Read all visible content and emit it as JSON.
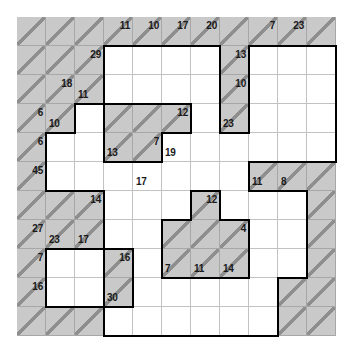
{
  "puzzle": {
    "type": "kakuro",
    "title": "Kakuro puzzle grid",
    "grid_size": {
      "cols": 11,
      "rows": 11
    },
    "cell_px": 29,
    "colors": {
      "shaded_cell": "#c9c9c9",
      "open_cell": "#ffffff",
      "diagonal_line": "#8e8e8e",
      "thin_grid_line": "#c2c2c2",
      "outline": "#000000",
      "clue_text": "#1a1a1a"
    },
    "clues": [
      {
        "name": "clue-r0c3-down",
        "row": 0,
        "col": 3,
        "dir": "down",
        "value": "11"
      },
      {
        "name": "clue-r0c4-down",
        "row": 0,
        "col": 4,
        "dir": "down",
        "value": "10"
      },
      {
        "name": "clue-r0c5-down",
        "row": 0,
        "col": 5,
        "dir": "down",
        "value": "17"
      },
      {
        "name": "clue-r0c6-down",
        "row": 0,
        "col": 6,
        "dir": "down",
        "value": "20"
      },
      {
        "name": "clue-r0c8-down",
        "row": 0,
        "col": 8,
        "dir": "down",
        "value": "7"
      },
      {
        "name": "clue-r0c9-down",
        "row": 0,
        "col": 9,
        "dir": "down",
        "value": "23"
      },
      {
        "name": "clue-r1c2-down",
        "row": 1,
        "col": 2,
        "dir": "down",
        "value": "29"
      },
      {
        "name": "clue-r1c7-down",
        "row": 1,
        "col": 7,
        "dir": "down",
        "value": "13"
      },
      {
        "name": "clue-r2c1-down",
        "row": 2,
        "col": 1,
        "dir": "down",
        "value": "18"
      },
      {
        "name": "clue-r2c2-across",
        "row": 2,
        "col": 2,
        "dir": "across",
        "value": "11"
      },
      {
        "name": "clue-r2c7-down",
        "row": 2,
        "col": 7,
        "dir": "down",
        "value": "10"
      },
      {
        "name": "clue-r3c0-down",
        "row": 3,
        "col": 0,
        "dir": "down",
        "value": "6"
      },
      {
        "name": "clue-r3c1-across",
        "row": 3,
        "col": 1,
        "dir": "across",
        "value": "10"
      },
      {
        "name": "clue-r3c7-across",
        "row": 3,
        "col": 7,
        "dir": "across",
        "value": "23"
      },
      {
        "name": "clue-r3c5-down",
        "row": 3,
        "col": 5,
        "dir": "down",
        "value": "12"
      },
      {
        "name": "clue-r4c0-down",
        "row": 4,
        "col": 0,
        "dir": "down",
        "value": "6"
      },
      {
        "name": "clue-r4c3-across",
        "row": 4,
        "col": 3,
        "dir": "across",
        "value": "13"
      },
      {
        "name": "clue-r4c5-across",
        "row": 4,
        "col": 5,
        "dir": "across",
        "value": "19"
      },
      {
        "name": "clue-r4c4-down",
        "row": 4,
        "col": 4,
        "dir": "down",
        "value": "7"
      },
      {
        "name": "clue-r5c0-down",
        "row": 5,
        "col": 0,
        "dir": "down",
        "value": "45"
      },
      {
        "name": "clue-r5c4-across",
        "row": 5,
        "col": 4,
        "dir": "across",
        "value": "17"
      },
      {
        "name": "clue-r5c8-across",
        "row": 5,
        "col": 8,
        "dir": "across",
        "value": "11"
      },
      {
        "name": "clue-r5c9-across",
        "row": 5,
        "col": 9,
        "dir": "across",
        "value": "8"
      },
      {
        "name": "clue-r6c2-down",
        "row": 6,
        "col": 2,
        "dir": "down",
        "value": "14"
      },
      {
        "name": "clue-r6c6-down",
        "row": 6,
        "col": 6,
        "dir": "down",
        "value": "12"
      },
      {
        "name": "clue-r7c0-down",
        "row": 7,
        "col": 0,
        "dir": "down",
        "value": "27"
      },
      {
        "name": "clue-r7c1-across",
        "row": 7,
        "col": 1,
        "dir": "across",
        "value": "23"
      },
      {
        "name": "clue-r7c2-across",
        "row": 7,
        "col": 2,
        "dir": "across",
        "value": "17"
      },
      {
        "name": "clue-r7c7-down",
        "row": 7,
        "col": 7,
        "dir": "down",
        "value": "4"
      },
      {
        "name": "clue-r8c0-down",
        "row": 8,
        "col": 0,
        "dir": "down",
        "value": "7"
      },
      {
        "name": "clue-r8c3-down",
        "row": 8,
        "col": 3,
        "dir": "down",
        "value": "16"
      },
      {
        "name": "clue-r8c5-across",
        "row": 8,
        "col": 5,
        "dir": "across",
        "value": "7"
      },
      {
        "name": "clue-r8c6-across",
        "row": 8,
        "col": 6,
        "dir": "across",
        "value": "11"
      },
      {
        "name": "clue-r8c7-across",
        "row": 8,
        "col": 7,
        "dir": "across",
        "value": "14"
      },
      {
        "name": "clue-r9c0-down",
        "row": 9,
        "col": 0,
        "dir": "down",
        "value": "16"
      },
      {
        "name": "clue-r9c3-across",
        "row": 9,
        "col": 3,
        "dir": "across",
        "value": "30"
      }
    ],
    "shaded_cells": [
      [
        0,
        0
      ],
      [
        0,
        1
      ],
      [
        0,
        2
      ],
      [
        0,
        3
      ],
      [
        0,
        4
      ],
      [
        0,
        5
      ],
      [
        0,
        6
      ],
      [
        0,
        7
      ],
      [
        0,
        8
      ],
      [
        0,
        9
      ],
      [
        0,
        10
      ],
      [
        1,
        0
      ],
      [
        1,
        1
      ],
      [
        1,
        2
      ],
      [
        1,
        7
      ],
      [
        2,
        0
      ],
      [
        2,
        1
      ],
      [
        2,
        2
      ],
      [
        2,
        7
      ],
      [
        3,
        0
      ],
      [
        3,
        1
      ],
      [
        3,
        3
      ],
      [
        3,
        4
      ],
      [
        3,
        5
      ],
      [
        3,
        7
      ],
      [
        4,
        0
      ],
      [
        4,
        3
      ],
      [
        4,
        4
      ],
      [
        5,
        0
      ],
      [
        5,
        8
      ],
      [
        5,
        9
      ],
      [
        5,
        10
      ],
      [
        6,
        0
      ],
      [
        6,
        1
      ],
      [
        6,
        2
      ],
      [
        6,
        6
      ],
      [
        6,
        10
      ],
      [
        7,
        0
      ],
      [
        7,
        1
      ],
      [
        7,
        2
      ],
      [
        7,
        5
      ],
      [
        7,
        6
      ],
      [
        7,
        7
      ],
      [
        7,
        10
      ],
      [
        8,
        0
      ],
      [
        8,
        3
      ],
      [
        8,
        5
      ],
      [
        8,
        6
      ],
      [
        8,
        7
      ],
      [
        8,
        10
      ],
      [
        9,
        0
      ],
      [
        9,
        3
      ],
      [
        9,
        9
      ],
      [
        9,
        10
      ],
      [
        10,
        0
      ],
      [
        10,
        1
      ],
      [
        10,
        2
      ],
      [
        10,
        9
      ],
      [
        10,
        10
      ]
    ],
    "open_cells": [
      [
        1,
        3
      ],
      [
        1,
        4
      ],
      [
        1,
        5
      ],
      [
        1,
        6
      ],
      [
        1,
        8
      ],
      [
        1,
        9
      ],
      [
        1,
        10
      ],
      [
        2,
        3
      ],
      [
        2,
        4
      ],
      [
        2,
        5
      ],
      [
        2,
        6
      ],
      [
        2,
        8
      ],
      [
        2,
        9
      ],
      [
        2,
        10
      ],
      [
        3,
        2
      ],
      [
        3,
        6
      ],
      [
        3,
        8
      ],
      [
        3,
        9
      ],
      [
        3,
        10
      ],
      [
        4,
        1
      ],
      [
        4,
        2
      ],
      [
        4,
        5
      ],
      [
        4,
        6
      ],
      [
        4,
        7
      ],
      [
        4,
        8
      ],
      [
        4,
        9
      ],
      [
        4,
        10
      ],
      [
        5,
        1
      ],
      [
        5,
        2
      ],
      [
        5,
        3
      ],
      [
        5,
        4
      ],
      [
        5,
        5
      ],
      [
        5,
        6
      ],
      [
        5,
        7
      ],
      [
        6,
        3
      ],
      [
        6,
        4
      ],
      [
        6,
        5
      ],
      [
        6,
        7
      ],
      [
        6,
        8
      ],
      [
        6,
        9
      ],
      [
        7,
        3
      ],
      [
        7,
        4
      ],
      [
        7,
        8
      ],
      [
        7,
        9
      ],
      [
        8,
        1
      ],
      [
        8,
        2
      ],
      [
        8,
        4
      ],
      [
        8,
        8
      ],
      [
        8,
        9
      ],
      [
        9,
        1
      ],
      [
        9,
        2
      ],
      [
        9,
        4
      ],
      [
        9,
        5
      ],
      [
        9,
        6
      ],
      [
        9,
        7
      ],
      [
        9,
        8
      ],
      [
        10,
        3
      ],
      [
        10,
        4
      ],
      [
        10,
        5
      ],
      [
        10,
        6
      ],
      [
        10,
        7
      ],
      [
        10,
        8
      ]
    ]
  }
}
